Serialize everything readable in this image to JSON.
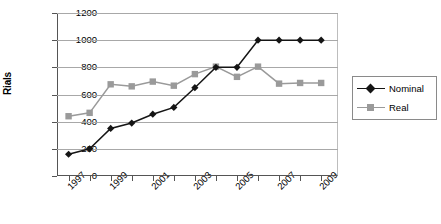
{
  "chart_data": {
    "type": "line",
    "title": "",
    "xlabel": "",
    "ylabel": "Rials",
    "ylim": [
      0,
      1200
    ],
    "yticks": [
      0,
      200,
      400,
      600,
      800,
      1000,
      1200
    ],
    "grid": true,
    "legend_position": "right",
    "x": [
      1997,
      1998,
      1999,
      2000,
      2001,
      2002,
      2003,
      2004,
      2005,
      2006,
      2007,
      2008,
      2009
    ],
    "xtick_labels": [
      "1997",
      "1999",
      "2001",
      "2003",
      "2005",
      "2007",
      "2009"
    ],
    "xtick_values": [
      1997,
      1999,
      2001,
      2003,
      2005,
      2007,
      2009
    ],
    "series": [
      {
        "name": "Nominal",
        "color": "#151515",
        "marker": "diamond",
        "values": [
          160,
          200,
          350,
          390,
          455,
          505,
          650,
          800,
          800,
          1000,
          1000,
          1000,
          1000
        ]
      },
      {
        "name": "Real",
        "color": "#9a9a9a",
        "marker": "square",
        "values": [
          440,
          465,
          675,
          660,
          695,
          665,
          750,
          805,
          730,
          805,
          680,
          685,
          685
        ]
      }
    ]
  },
  "legend": {
    "items": [
      {
        "label": "Nominal"
      },
      {
        "label": "Real"
      }
    ]
  },
  "colors": {
    "nominal": "#151515",
    "real": "#9a9a9a",
    "grid": "#a8a8a8",
    "axis": "#555555"
  }
}
